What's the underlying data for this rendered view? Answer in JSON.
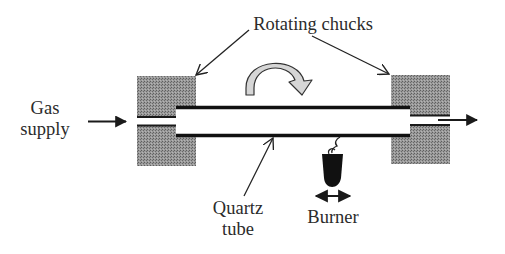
{
  "diagram": {
    "title": "",
    "labels": {
      "rotating_chucks": "Rotating chucks",
      "gas_supply_line1": "Gas",
      "gas_supply_line2": "supply",
      "quartz_tube_line1": "Quartz",
      "quartz_tube_line2": "tube",
      "burner": "Burner"
    },
    "components": [
      {
        "id": "left-chuck",
        "name": "Rotating chuck (left)"
      },
      {
        "id": "right-chuck",
        "name": "Rotating chuck (right)"
      },
      {
        "id": "quartz-tube",
        "name": "Quartz tube"
      },
      {
        "id": "burner",
        "name": "Burner"
      },
      {
        "id": "rotation-arrow",
        "name": "Rotation direction"
      }
    ],
    "flows": [
      {
        "from": "Gas supply",
        "to": "left-chuck",
        "direction": "right"
      },
      {
        "from": "right-chuck",
        "to": "exhaust",
        "direction": "right"
      }
    ],
    "icons": {
      "rotation": "curved-rotation-arrow-icon",
      "burner_motion": "double-headed-arrow-icon",
      "gas_in": "arrow-right-icon",
      "gas_out": "arrow-right-icon"
    },
    "colors": {
      "chuck_fill": "#8a8a8a",
      "tube_wall": "#1a1a1a",
      "rotation_arrow_fill": "#d6d6d6",
      "burner_fill": "#111111",
      "text": "#2b2b2b"
    }
  }
}
